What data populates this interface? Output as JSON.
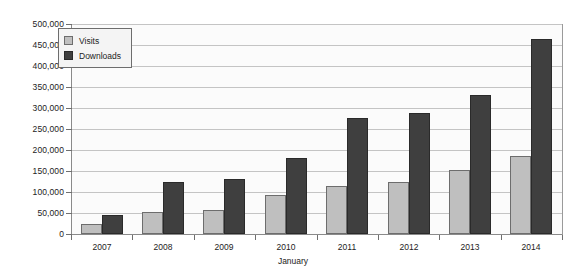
{
  "chart_data": {
    "type": "bar",
    "title": "",
    "xlabel": "January",
    "ylabel": "",
    "categories": [
      "2007",
      "2008",
      "2009",
      "2010",
      "2011",
      "2012",
      "2013",
      "2014"
    ],
    "series": [
      {
        "name": "Visits",
        "color": "#bfbfbf",
        "values": [
          24000,
          52000,
          57000,
          92000,
          115000,
          124000,
          152000,
          186000
        ]
      },
      {
        "name": "Downloads",
        "color": "#3f3f3f",
        "values": [
          45000,
          124000,
          130000,
          182000,
          277000,
          287000,
          331000,
          464000
        ]
      }
    ],
    "ylim": [
      0,
      500000
    ],
    "ytick_values": [
      0,
      50000,
      100000,
      150000,
      200000,
      250000,
      300000,
      350000,
      400000,
      450000,
      500000
    ],
    "ytick_labels": [
      "0",
      "50,000",
      "100,000",
      "150,000",
      "200,000",
      "250,000",
      "300,000",
      "350,000",
      "400,000",
      "450,000",
      "500,000"
    ],
    "grid": true,
    "legend_position": "top-left",
    "legend_entries": [
      "Visits",
      "Downloads"
    ]
  }
}
